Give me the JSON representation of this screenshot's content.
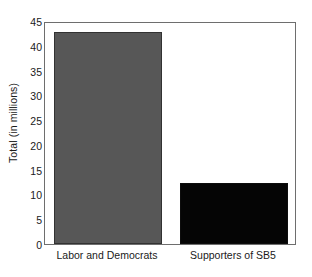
{
  "chart_data": {
    "type": "bar",
    "title": "",
    "subtitle": "",
    "xlabel": "",
    "ylabel": "Total (in millions)",
    "categories": [
      "Labor and Democrats",
      "Supporters of SB5"
    ],
    "values": [
      42.8,
      12.4
    ],
    "series": [
      {
        "name": "Total",
        "values": [
          42.8,
          12.4
        ],
        "colors": [
          "#575757",
          "#050505"
        ]
      }
    ],
    "ylim": [
      0,
      45
    ],
    "yticks": [
      0,
      5,
      10,
      15,
      20,
      25,
      30,
      35,
      40,
      45
    ],
    "ytick_labels": [
      "0",
      "5",
      "10",
      "15",
      "20",
      "25",
      "30",
      "35",
      "40",
      "45"
    ],
    "grid": false,
    "legend": "none",
    "frame": true,
    "bar_colors": {
      "labor_and_democrats": "#575757",
      "supporters_of_sb5": "#050505"
    },
    "axis_color": "#6e6e6e",
    "text_color": "#1a1a1a",
    "background": "#ffffff"
  }
}
